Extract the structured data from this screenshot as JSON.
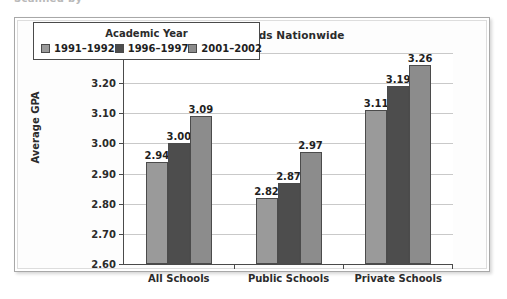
{
  "page": {
    "clipped_header_text": "Scanned by"
  },
  "figure": {
    "title": "Recent GPA Trends Nationwide"
  },
  "legend": {
    "title": "Academic Year",
    "items": [
      {
        "label": "1991–1992",
        "color": "#9a9a9a"
      },
      {
        "label": "1996–1997",
        "color": "#4d4d4d"
      },
      {
        "label": "2001–2002",
        "color": "#8c8c8c"
      }
    ]
  },
  "axes": {
    "y_title": "Average GPA",
    "y_ticks": [
      "2.60",
      "2.70",
      "2.80",
      "2.90",
      "3.00",
      "3.10",
      "3.20",
      "3.30"
    ],
    "x_categories": [
      "All Schools",
      "Public Schools",
      "Private Schools"
    ]
  },
  "chart_data": {
    "type": "bar",
    "title": "Recent GPA Trends Nationwide",
    "xlabel": "",
    "ylabel": "Average GPA",
    "ylim": [
      2.6,
      3.3
    ],
    "ytick_step": 0.1,
    "grid": true,
    "legend_position": "inside-top-left",
    "legend_title": "Academic Year",
    "categories": [
      "All Schools",
      "Public Schools",
      "Private Schools"
    ],
    "series": [
      {
        "name": "1991–1992",
        "color": "#9a9a9a",
        "values": [
          2.94,
          2.82,
          3.11
        ],
        "labels": [
          "2.94",
          "2.82",
          "3.11"
        ]
      },
      {
        "name": "1996–1997",
        "color": "#4d4d4d",
        "values": [
          3.0,
          2.87,
          3.19
        ],
        "labels": [
          "3.00",
          "2.87",
          "3.19"
        ]
      },
      {
        "name": "2001–2002",
        "color": "#8c8c8c",
        "values": [
          3.09,
          2.97,
          3.26
        ],
        "labels": [
          "3.09",
          "2.97",
          "3.26"
        ]
      }
    ]
  }
}
